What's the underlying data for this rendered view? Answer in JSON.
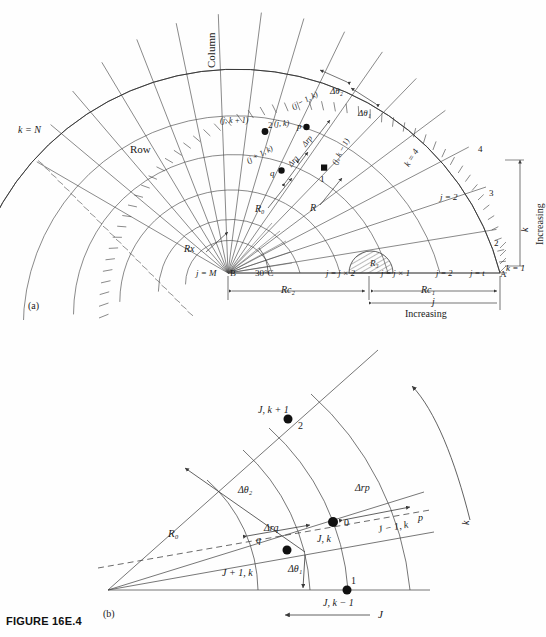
{
  "figure": {
    "caption": "FIGURE 16E.4",
    "panel_a_tag": "(a)",
    "panel_b_tag": "(b)"
  },
  "panel_a": {
    "title_labels": {
      "column": "Column",
      "row": "Row"
    },
    "boundary_labels": {
      "k_equals_N": "k = N",
      "k_equals_1": "k = 1",
      "j_equals_M": "j = M",
      "point_B": "B",
      "point_A": "A",
      "angle": "30°C"
    },
    "node_labels": {
      "p_node": "p",
      "q_node": "q",
      "node_0": "2",
      "node_1": "1",
      "center": "(j, k)",
      "up": "(j, k + 1)",
      "down": "(j, k − 1)",
      "inner": "(j + 1, k)",
      "outer": "(j − 1, k)"
    },
    "spacing_labels": {
      "dtheta1": "Δθ₁",
      "dtheta2": "Δθ₂",
      "drp": "Δrp",
      "drq": "Δrq"
    },
    "radius_labels": {
      "R0": "R₀",
      "R": "R",
      "Rx": "Rx",
      "R3": "R₃",
      "Rc1": "Rc₁",
      "Rc2": "Rc₂"
    },
    "index_labels": {
      "k4": "k = 4",
      "j2_diag": "j = 2",
      "ring_4": "4",
      "ring_3": "3",
      "ring_2": "2",
      "j_jx2": "j = j × 2",
      "j_jx1": "j = j × 1",
      "j_2": "j = 2",
      "j_t": "j = t"
    },
    "direction_labels": {
      "increasing_k": "Increasing",
      "k_axis": "k",
      "increasing_j": "Increasing",
      "j_axis": "j"
    }
  },
  "panel_b": {
    "node_labels": {
      "center": "J, k",
      "center_num": "0",
      "up": "J, k + 1",
      "up_num": "2",
      "down": "J, k − 1",
      "down_num": "1",
      "inner": "J + 1, k",
      "inner_sym": "q",
      "outer": "J − 1, k",
      "outer_sym": "p"
    },
    "spacing_labels": {
      "dtheta1": "Δθ₁",
      "dtheta2": "Δθ₂",
      "drp": "Δrp",
      "drq": "Δrq"
    },
    "radius_labels": {
      "R0": "R₀"
    },
    "direction_labels": {
      "k_axis": "k",
      "j_axis": "J"
    }
  },
  "style": {
    "line_color": "#3a3a3a",
    "text_color": "#1a1a1a",
    "background": "#fefefe",
    "node_fill": "#111111"
  }
}
